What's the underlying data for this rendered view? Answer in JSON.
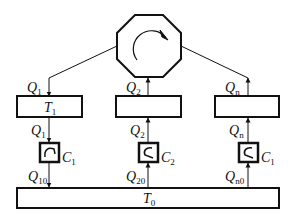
{
  "diagram": {
    "central_node": {
      "name": "rotating-device",
      "icon": "rotation-arrow-icon",
      "shape": "octagon"
    },
    "branches": [
      {
        "id": 1,
        "upper_flow": {
          "symbol": "Q",
          "sub": "1",
          "direction": "down"
        },
        "tank": {
          "symbol": "T",
          "sub": "1"
        },
        "mid_flow": {
          "symbol": "Q",
          "sub": "1",
          "direction": "down"
        },
        "controller": {
          "symbol": "C",
          "sub": "1"
        },
        "lower_flow": {
          "symbol": "Q",
          "sub": "10",
          "direction": "down"
        }
      },
      {
        "id": 2,
        "upper_flow": {
          "symbol": "Q",
          "sub": "2",
          "direction": "up"
        },
        "tank": {
          "symbol": "",
          "sub": ""
        },
        "mid_flow": {
          "symbol": "Q",
          "sub": "2",
          "direction": "up"
        },
        "controller": {
          "symbol": "C",
          "sub": "2"
        },
        "lower_flow": {
          "symbol": "Q",
          "sub": "20",
          "direction": "up"
        }
      },
      {
        "id": "n",
        "upper_flow": {
          "symbol": "Q",
          "sub": "n",
          "direction": "up"
        },
        "tank": {
          "symbol": "",
          "sub": ""
        },
        "mid_flow": {
          "symbol": "Q",
          "sub": "n",
          "direction": "up"
        },
        "controller": {
          "symbol": "C",
          "sub": "1"
        },
        "lower_flow": {
          "symbol": "Q",
          "sub": "n0",
          "direction": "up"
        }
      }
    ],
    "base_tank": {
      "symbol": "T",
      "sub": "0"
    },
    "colors": {
      "stroke": "#111111",
      "background": "#ffffff"
    }
  }
}
